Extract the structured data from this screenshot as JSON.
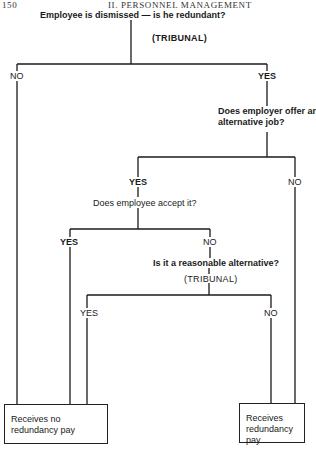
{
  "page_header": {
    "page_number": "150",
    "section": "II. PERSONNEL MANAGEMENT"
  },
  "nodes": {
    "q1": {
      "text": "Employee is dismissed — is he redundant?",
      "decider": "(TRIBUNAL)"
    },
    "q1_no": "NO",
    "q1_yes": "YES",
    "q2": {
      "line1": "Does employer offer an",
      "line2": "alternative job?"
    },
    "q2_yes": "YES",
    "q2_no": "NO",
    "q3": {
      "text": "Does employee accept it?"
    },
    "q3_yes": "YES",
    "q3_no": "NO",
    "q4": {
      "text": "Is it a reasonable alternative?",
      "decider": "(TRIBUNAL)"
    },
    "q4_yes": "YES",
    "q4_no": "NO"
  },
  "outcomes": {
    "no_pay": "Receives no redundancy pay",
    "pay": "Receives redundancy pay"
  },
  "colors": {
    "line": "#1a1a1a",
    "background": "#ffffff"
  }
}
